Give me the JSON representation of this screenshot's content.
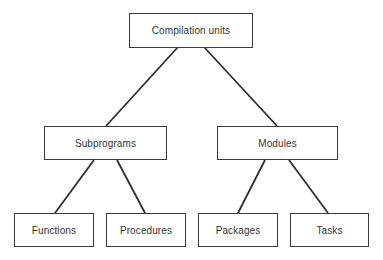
{
  "diagram": {
    "type": "tree",
    "root": {
      "label": "Compilation units",
      "children": [
        {
          "label": "Subprograms",
          "children": [
            {
              "label": "Functions"
            },
            {
              "label": "Procedures"
            }
          ]
        },
        {
          "label": "Modules",
          "children": [
            {
              "label": "Packages"
            },
            {
              "label": "Tasks"
            }
          ]
        }
      ]
    }
  },
  "nodes": {
    "compilation_units": "Compilation units",
    "subprograms": "Subprograms",
    "modules": "Modules",
    "functions": "Functions",
    "procedures": "Procedures",
    "packages": "Packages",
    "tasks": "Tasks"
  },
  "colors": {
    "line": "#2e2e2e",
    "border": "#3a3a3a",
    "background": "#ffffff"
  }
}
